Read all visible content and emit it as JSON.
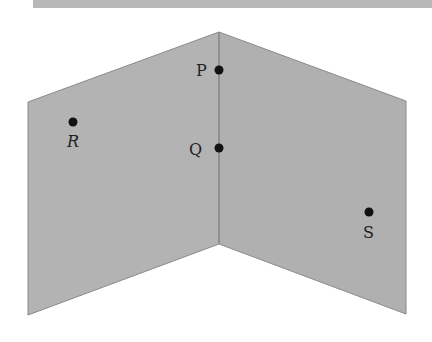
{
  "diagram": {
    "type": "intersecting-planes",
    "colors": {
      "plane_fill": "#b3b3b3",
      "plane_edge": "#8a8a8a",
      "point": "#111111"
    },
    "points": [
      {
        "label": "P",
        "x": 219,
        "y": 70,
        "label_x": 196,
        "label_y": 76
      },
      {
        "label": "Q",
        "x": 219,
        "y": 148,
        "label_x": 189,
        "label_y": 155
      },
      {
        "label": "R",
        "x": 73,
        "y": 122,
        "label_x": 67,
        "label_y": 147
      },
      {
        "label": "S",
        "x": 369,
        "y": 212,
        "label_x": 363,
        "label_y": 238
      }
    ]
  }
}
